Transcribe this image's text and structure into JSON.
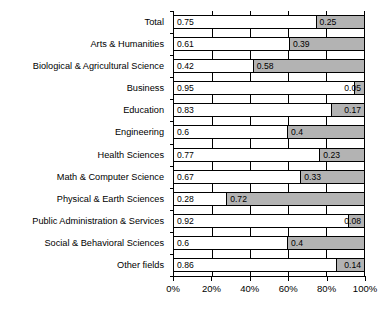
{
  "chart_data": {
    "type": "bar",
    "orientation": "horizontal",
    "stacked": true,
    "normalized": true,
    "title": "",
    "subtitle": "",
    "xlabel": "",
    "ylabel": "",
    "xlim": [
      0,
      1
    ],
    "xticks": [
      0,
      0.2,
      0.4,
      0.6,
      0.8,
      1.0
    ],
    "xtick_labels": [
      "0%",
      "20%",
      "40%",
      "60%",
      "80%",
      "100%"
    ],
    "grid": true,
    "grid_axis": "x",
    "legend": null,
    "legend_position": "none",
    "categories": [
      "Total",
      "Arts & Humanities",
      "Biological & Agricultural Science",
      "Business",
      "Education",
      "Engineering",
      "Health Sciences",
      "Math & Computer Science",
      "Physical & Earth Sciences",
      "Public Administration & Services",
      "Social & Behavioral Sciences",
      "Other fields"
    ],
    "series": [
      {
        "name": "segment-1",
        "color": "#ffffff",
        "values": [
          0.75,
          0.61,
          0.42,
          0.95,
          0.83,
          0.6,
          0.77,
          0.67,
          0.28,
          0.92,
          0.6,
          0.86
        ],
        "labels": [
          "0.75",
          "0.61",
          "0.42",
          "0.95",
          "0.83",
          "0.6",
          "0.77",
          "0.67",
          "0.28",
          "0.92",
          "0.6",
          "0.86"
        ]
      },
      {
        "name": "segment-2",
        "color": "#b3b3b3",
        "values": [
          0.25,
          0.39,
          0.58,
          0.05,
          0.17,
          0.4,
          0.23,
          0.33,
          0.72,
          0.08,
          0.4,
          0.14
        ],
        "labels": [
          "0.25",
          "0.39",
          "0.58",
          "0.05",
          "0.17",
          "0.4",
          "0.23",
          "0.33",
          "0.72",
          "0.08",
          "0.4",
          "0.14"
        ]
      }
    ]
  }
}
